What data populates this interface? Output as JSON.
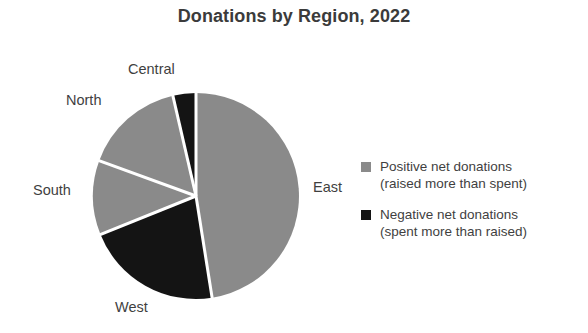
{
  "chart_data": {
    "type": "pie",
    "title": "Donations by Region, 2022",
    "categories": [
      "East",
      "West",
      "South",
      "North",
      "Central"
    ],
    "values": [
      47.5,
      21.4,
      11.7,
      15.8,
      3.6
    ],
    "units": "percent of total donations",
    "start_angle_deg": 0,
    "direction": "clockwise",
    "slices": [
      {
        "label": "East",
        "value": 47.5,
        "start_angle_deg": 0,
        "end_angle_deg": 171,
        "color": "#8a8a8a",
        "group": "Positive net donations",
        "label_position": "right"
      },
      {
        "label": "West",
        "value": 21.4,
        "start_angle_deg": 171,
        "end_angle_deg": 248,
        "color": "#141414",
        "group": "Negative net donations",
        "label_position": "bottom-left"
      },
      {
        "label": "South",
        "value": 11.7,
        "start_angle_deg": 248,
        "end_angle_deg": 290,
        "color": "#8a8a8a",
        "group": "Positive net donations",
        "label_position": "left"
      },
      {
        "label": "North",
        "value": 15.8,
        "start_angle_deg": 290,
        "end_angle_deg": 347,
        "color": "#8a8a8a",
        "group": "Positive net donations",
        "label_position": "top-left"
      },
      {
        "label": "Central",
        "value": 3.6,
        "start_angle_deg": 347,
        "end_angle_deg": 360,
        "color": "#141414",
        "group": "Negative net donations",
        "label_position": "top"
      }
    ],
    "legend": {
      "position": "right",
      "entries": [
        {
          "color": "#8a8a8a",
          "line1": "Positive net donations",
          "line2": "(raised more than spent)"
        },
        {
          "color": "#141414",
          "line1": "Negative net donations",
          "line2": "(spent more than raised)"
        }
      ]
    },
    "colors": {
      "positive": "#8a8a8a",
      "negative": "#141414",
      "separator": "#ffffff",
      "text": "#3f3f3f",
      "title": "#3b3b3b",
      "background": "#ffffff"
    },
    "geometry": {
      "center_x": 104,
      "center_y": 104,
      "radius": 103,
      "separator_width": 3
    }
  }
}
